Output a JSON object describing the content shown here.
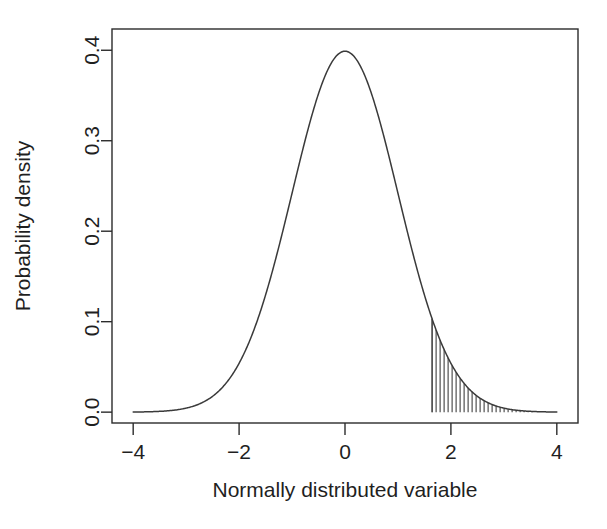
{
  "chart_data": {
    "type": "line",
    "title": "",
    "subtitle": "",
    "xlabel": "Normally distributed variable",
    "ylabel": "Probability density",
    "xlim": [
      -4.4,
      4.4
    ],
    "ylim": [
      -0.012,
      0.4235
    ],
    "grid": false,
    "legend": null,
    "distribution": {
      "name": "standard normal",
      "mean": 0,
      "sd": 1,
      "peak_x": 0,
      "peak_y": 0.3989
    },
    "x_ticks": [
      -4,
      -2,
      0,
      2,
      4
    ],
    "x_tick_labels": [
      "−4",
      "−2",
      "0",
      "2",
      "4"
    ],
    "y_ticks": [
      0.0,
      0.1,
      0.2,
      0.3,
      0.4
    ],
    "y_tick_labels": [
      "0.0",
      "0.1",
      "0.2",
      "0.3",
      "0.4"
    ],
    "shaded_region": {
      "label": "upper tail",
      "x_start": 1.645,
      "x_end": 4.0,
      "fill_style": "vertical-hatch",
      "hatch_spacing_px": 4,
      "density_at_start": 0.1031,
      "area": 0.05
    },
    "series": [
      {
        "name": "standard normal density",
        "x": [
          -4.0,
          -3.8,
          -3.6,
          -3.4,
          -3.2,
          -3.0,
          -2.8,
          -2.6,
          -2.4,
          -2.2,
          -2.0,
          -1.8,
          -1.6,
          -1.4,
          -1.2,
          -1.0,
          -0.8,
          -0.6,
          -0.4,
          -0.2,
          0.0,
          0.2,
          0.4,
          0.6,
          0.8,
          1.0,
          1.2,
          1.4,
          1.6,
          1.8,
          2.0,
          2.2,
          2.4,
          2.6,
          2.8,
          3.0,
          3.2,
          3.4,
          3.6,
          3.8,
          4.0
        ],
        "values": [
          0.0001,
          0.0003,
          0.0006,
          0.0012,
          0.0024,
          0.0044,
          0.0079,
          0.0136,
          0.0224,
          0.0355,
          0.054,
          0.079,
          0.1109,
          0.1497,
          0.1942,
          0.242,
          0.2897,
          0.3332,
          0.3683,
          0.391,
          0.3989,
          0.391,
          0.3683,
          0.3332,
          0.2897,
          0.242,
          0.1942,
          0.1497,
          0.1109,
          0.079,
          0.054,
          0.0355,
          0.0224,
          0.0136,
          0.0079,
          0.0044,
          0.0024,
          0.0012,
          0.0006,
          0.0003,
          0.0001
        ]
      }
    ]
  },
  "figure": {
    "background_color": "#ffffff",
    "line_color": "#3a3a3a",
    "axis_color": "#2b2b2b"
  }
}
